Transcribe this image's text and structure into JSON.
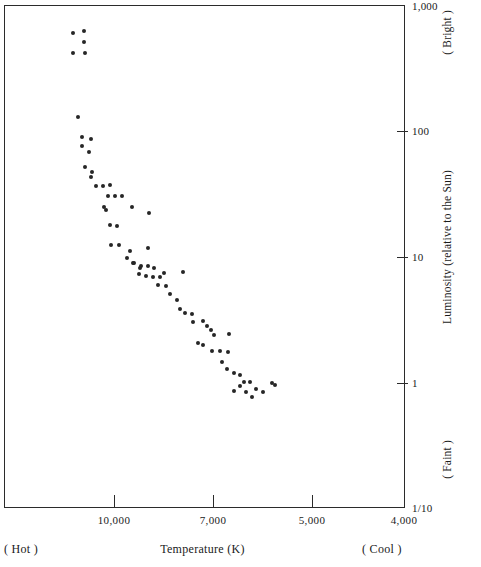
{
  "chart_data": {
    "type": "scatter",
    "title": "",
    "subtitle": "",
    "xlabel": "Temperature (K)",
    "ylabel": "Luminosity (relative to the Sun)",
    "x_axis": {
      "label": "Temperature (K)",
      "scale": "log-reversed",
      "direction_hint_low": "( Hot )",
      "direction_hint_high": "( Cool )",
      "ticks": [
        {
          "value": 10000,
          "label": "10,000",
          "px": 110
        },
        {
          "value": 7000,
          "label": "7,000",
          "px": 209
        },
        {
          "value": 5000,
          "label": "5,000",
          "px": 308
        },
        {
          "value": 4000,
          "label": "4,000",
          "px": 400
        }
      ],
      "xlim": [
        14500,
        3850
      ]
    },
    "y_axis": {
      "label": "Luminosity (relative to the Sun)",
      "scale": "log",
      "direction_hint_high": "( Bright )",
      "direction_hint_low": "( Faint )",
      "ticks": [
        {
          "value": 1000,
          "label": "1,000",
          "px": 1
        },
        {
          "value": 100,
          "label": "100",
          "px": 126
        },
        {
          "value": 10,
          "label": "10",
          "px": 252
        },
        {
          "value": 1,
          "label": "1",
          "px": 378
        },
        {
          "value": 0.1,
          "label": "1/10",
          "px": 503
        }
      ],
      "ylim": [
        0.1,
        1000
      ]
    },
    "grid": false,
    "legend": null,
    "series": [
      {
        "name": "stars",
        "marker": "filled-circle",
        "color": "#262626",
        "points": [
          {
            "px": 69,
            "py": 28,
            "t": 11600,
            "l": 560
          },
          {
            "px": 80,
            "py": 26,
            "t": 11350,
            "l": 600
          },
          {
            "px": 80,
            "py": 37,
            "t": 11350,
            "l": 480
          },
          {
            "px": 69,
            "py": 48,
            "t": 11600,
            "l": 390
          },
          {
            "px": 81,
            "py": 48,
            "t": 11330,
            "l": 390
          },
          {
            "px": 74,
            "py": 112,
            "t": 11500,
            "l": 126
          },
          {
            "px": 78,
            "py": 132,
            "t": 11400,
            "l": 93
          },
          {
            "px": 87,
            "py": 134,
            "t": 11200,
            "l": 90
          },
          {
            "px": 78,
            "py": 141,
            "t": 11400,
            "l": 82
          },
          {
            "px": 85,
            "py": 147,
            "t": 11250,
            "l": 75
          },
          {
            "px": 81,
            "py": 162,
            "t": 11320,
            "l": 60
          },
          {
            "px": 88,
            "py": 167,
            "t": 11170,
            "l": 55
          },
          {
            "px": 87,
            "py": 172,
            "t": 11180,
            "l": 51
          },
          {
            "px": 92,
            "py": 181,
            "t": 11070,
            "l": 44
          },
          {
            "px": 99,
            "py": 181,
            "t": 10920,
            "l": 44
          },
          {
            "px": 106,
            "py": 180,
            "t": 10780,
            "l": 45
          },
          {
            "px": 104,
            "py": 191,
            "t": 10820,
            "l": 37
          },
          {
            "px": 111,
            "py": 191,
            "t": 10680,
            "l": 37
          },
          {
            "px": 118,
            "py": 191,
            "t": 10540,
            "l": 37
          },
          {
            "px": 100,
            "py": 202,
            "t": 10900,
            "l": 30
          },
          {
            "px": 128,
            "py": 202,
            "t": 10340,
            "l": 30
          },
          {
            "px": 102,
            "py": 205,
            "t": 10860,
            "l": 28
          },
          {
            "px": 145,
            "py": 208,
            "t": 10000,
            "l": 27
          },
          {
            "px": 106,
            "py": 220,
            "t": 10780,
            "l": 21
          },
          {
            "px": 113,
            "py": 221,
            "t": 10640,
            "l": 20
          },
          {
            "px": 107,
            "py": 240,
            "t": 10760,
            "l": 14
          },
          {
            "px": 115,
            "py": 240,
            "t": 10600,
            "l": 14
          },
          {
            "px": 126,
            "py": 246,
            "t": 10380,
            "l": 13
          },
          {
            "px": 144,
            "py": 243,
            "t": 10030,
            "l": 13.5
          },
          {
            "px": 129,
            "py": 258,
            "t": 10320,
            "l": 11
          },
          {
            "px": 136,
            "py": 263,
            "t": 10180,
            "l": 10
          },
          {
            "px": 123,
            "py": 253,
            "t": 10440,
            "l": 11.5
          },
          {
            "px": 130,
            "py": 258,
            "t": 10300,
            "l": 11
          },
          {
            "px": 137,
            "py": 261,
            "t": 10160,
            "l": 10.2
          },
          {
            "px": 144,
            "py": 261,
            "t": 10020,
            "l": 10.2
          },
          {
            "px": 150,
            "py": 263,
            "t": 9900,
            "l": 10
          },
          {
            "px": 135,
            "py": 269,
            "t": 10200,
            "l": 9.2
          },
          {
            "px": 142,
            "py": 271,
            "t": 10060,
            "l": 9
          },
          {
            "px": 149,
            "py": 272,
            "t": 9920,
            "l": 8.8
          },
          {
            "px": 156,
            "py": 272,
            "t": 9780,
            "l": 8.8
          },
          {
            "px": 160,
            "py": 268,
            "t": 9700,
            "l": 9.3
          },
          {
            "px": 154,
            "py": 280,
            "t": 9820,
            "l": 8
          },
          {
            "px": 162,
            "py": 281,
            "t": 9660,
            "l": 7.9
          },
          {
            "px": 179,
            "py": 267,
            "t": 9320,
            "l": 9.4
          },
          {
            "px": 166,
            "py": 289,
            "t": 9580,
            "l": 7.2
          },
          {
            "px": 173,
            "py": 295,
            "t": 9440,
            "l": 6.6
          },
          {
            "px": 176,
            "py": 304,
            "t": 9380,
            "l": 5.8
          },
          {
            "px": 181,
            "py": 308,
            "t": 9280,
            "l": 5.5
          },
          {
            "px": 188,
            "py": 309,
            "t": 9140,
            "l": 5.4
          },
          {
            "px": 189,
            "py": 317,
            "t": 9120,
            "l": 4.8
          },
          {
            "px": 199,
            "py": 316,
            "t": 8920,
            "l": 4.9
          },
          {
            "px": 203,
            "py": 321,
            "t": 8840,
            "l": 4.5
          },
          {
            "px": 207,
            "py": 325,
            "t": 8760,
            "l": 4.2
          },
          {
            "px": 210,
            "py": 330,
            "t": 8700,
            "l": 3.9
          },
          {
            "px": 225,
            "py": 329,
            "t": 8400,
            "l": 4.0
          },
          {
            "px": 194,
            "py": 338,
            "t": 9020,
            "l": 3.4
          },
          {
            "px": 199,
            "py": 340,
            "t": 8920,
            "l": 3.3
          },
          {
            "px": 208,
            "py": 346,
            "t": 8740,
            "l": 2.9
          },
          {
            "px": 216,
            "py": 346,
            "t": 8580,
            "l": 2.9
          },
          {
            "px": 224,
            "py": 347,
            "t": 8420,
            "l": 2.9
          },
          {
            "px": 218,
            "py": 357,
            "t": 8540,
            "l": 2.4
          },
          {
            "px": 223,
            "py": 364,
            "t": 8440,
            "l": 2.1
          },
          {
            "px": 230,
            "py": 368,
            "t": 8300,
            "l": 1.9
          },
          {
            "px": 236,
            "py": 370,
            "t": 8180,
            "l": 1.85
          },
          {
            "px": 240,
            "py": 377,
            "t": 8100,
            "l": 1.55
          },
          {
            "px": 246,
            "py": 377,
            "t": 7980,
            "l": 1.55
          },
          {
            "px": 242,
            "py": 387,
            "t": 8060,
            "l": 1.2
          },
          {
            "px": 268,
            "py": 378,
            "t": 7540,
            "l": 1.5
          },
          {
            "px": 252,
            "py": 384,
            "t": 7860,
            "l": 1.3
          },
          {
            "px": 259,
            "py": 387,
            "t": 7720,
            "l": 1.2
          },
          {
            "px": 248,
            "py": 392,
            "t": 7940,
            "l": 1.05
          },
          {
            "px": 236,
            "py": 381,
            "t": 8180,
            "l": 1.4
          },
          {
            "px": 230,
            "py": 386,
            "t": 8300,
            "l": 1.2
          },
          {
            "px": 271,
            "py": 380,
            "t": 7480,
            "l": 1.4
          }
        ]
      }
    ]
  },
  "axis_text": {
    "y_title": "Luminosity (relative to the Sun)",
    "y_bright": "( Bright )",
    "y_faint": "( Faint )",
    "x_title": "Temperature (K)",
    "x_hot": "( Hot )",
    "x_cool": "( Cool )"
  }
}
